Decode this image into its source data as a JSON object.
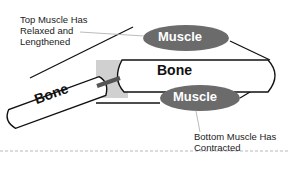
{
  "diagram": {
    "top_label": [
      "Top Muscle Has",
      "Relaxed and",
      "Lengthened"
    ],
    "bottom_label": [
      "Bottom Muscle Has",
      "Contracted"
    ],
    "top_muscle": "Muscle",
    "bottom_muscle": "Muscle",
    "upper_bone": "Bone",
    "lower_bone": "Bone",
    "colors": {
      "muscle": "#6b6b6b",
      "joint": "#cfcfcf",
      "divider": "#b0b0c0"
    }
  }
}
